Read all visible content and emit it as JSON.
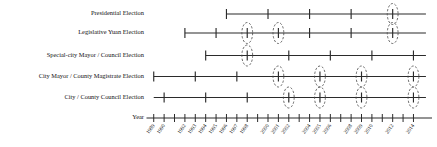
{
  "chart_data": {
    "type": "timeline",
    "title": "",
    "xlabel": "Year",
    "ylabel": "",
    "xlim": [
      1988.4,
      2015.4
    ],
    "grid": false,
    "legend": null,
    "axis": {
      "label": "Year",
      "tick_years": [
        1989,
        1990,
        1991,
        1992,
        1993,
        1994,
        1995,
        1996,
        1997,
        1998,
        1999,
        2000,
        2001,
        2002,
        2003,
        2004,
        2005,
        2006,
        2007,
        2008,
        2009,
        2010,
        2011,
        2012,
        2013,
        2014
      ],
      "tick_labels": [
        "1989",
        "1990",
        "",
        "1992",
        "1993",
        "1994",
        "1995",
        "1996",
        "1997",
        "1998",
        "",
        "2000",
        "2001",
        "2002",
        "",
        "2004",
        "2005",
        "2006",
        "",
        "2008",
        "2009",
        "2010",
        "",
        "2012",
        "",
        "2014"
      ],
      "label_rotation_deg": -55
    },
    "categories": [
      "Presidential Election",
      "Legislative Yuan Election",
      "Special-city Mayor / Council Election",
      "City Mayor / County Magistrate Election",
      "City / County Council Election"
    ],
    "series": [
      {
        "name": "Presidential Election",
        "line_start_year": 1996,
        "line_end_year": 2015.2,
        "event_years": [
          1996,
          2000,
          2004,
          2008,
          2012
        ],
        "highlight_years": [
          2012
        ]
      },
      {
        "name": "Legislative Yuan Election",
        "line_start_year": 1992,
        "line_end_year": 2015.2,
        "event_years": [
          1992,
          1995,
          1998,
          2001,
          2004,
          2008,
          2012
        ],
        "highlight_years": [
          1998,
          2001,
          2012
        ]
      },
      {
        "name": "Special-city Mayor / Council Election",
        "line_start_year": 1994,
        "line_end_year": 2015.2,
        "event_years": [
          1994,
          1998,
          2002,
          2006,
          2010,
          2014
        ],
        "highlight_years": [
          1998
        ]
      },
      {
        "name": "City Mayor / County Magistrate Election",
        "line_start_year": 1989,
        "line_end_year": 2015.2,
        "event_years": [
          1989,
          1993,
          1997,
          2001,
          2005,
          2009,
          2014
        ],
        "highlight_years": [
          2001,
          2005,
          2009,
          2014
        ]
      },
      {
        "name": "City / County Council Election",
        "line_start_year": 1989,
        "line_end_year": 2015.2,
        "event_years": [
          1990,
          1994,
          1998,
          2002,
          2005,
          2009,
          2014
        ],
        "highlight_years": [
          2002,
          2005,
          2009,
          2014
        ]
      }
    ],
    "colors": {
      "line": "#2b2b2b",
      "tick": "#2b2b2b",
      "highlight": "#4a4a4a",
      "text": "#111111",
      "background": "#ffffff"
    }
  }
}
